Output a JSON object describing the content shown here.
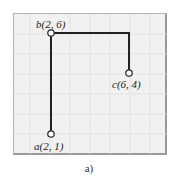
{
  "figure": {
    "caption": "a)",
    "points": [
      {
        "id": "a",
        "label": "a(2, 1)",
        "x": 2,
        "y": 1
      },
      {
        "id": "b",
        "label": "b(2, 6)",
        "x": 2,
        "y": 6
      },
      {
        "id": "c",
        "label": "c(6, 4)",
        "x": 6,
        "y": 4
      }
    ],
    "path": [
      "a",
      "b",
      "c"
    ],
    "colors": {
      "background": "#f1f1f1",
      "grid": "#e0e0e0",
      "line": "#222222",
      "node_fill": "#ffffff"
    }
  }
}
